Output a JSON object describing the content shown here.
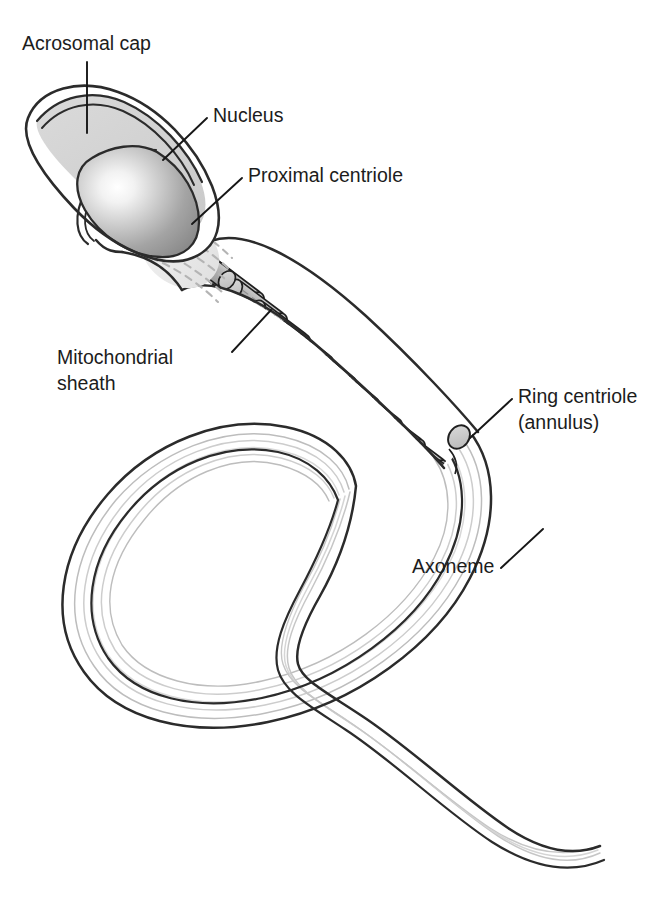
{
  "figure": {
    "background_color": "#ffffff",
    "line_color": "#2b2b2b",
    "text_color": "#1c1c1c"
  },
  "labels": [
    {
      "id": "acrosomal-cap",
      "text": "Acrosomal cap",
      "lines": [
        "Acrosomal cap"
      ],
      "text_x": 22,
      "text_y": 50,
      "anchor": "start",
      "leader": "M 87 62 L 87 133"
    },
    {
      "id": "nucleus",
      "text": "Nucleus",
      "lines": [
        "Nucleus"
      ],
      "text_x": 213,
      "text_y": 122,
      "anchor": "start",
      "leader": "M 207 118 L 163 160"
    },
    {
      "id": "proximal-centriole",
      "text": "Proximal centriole",
      "lines": [
        "Proximal centriole"
      ],
      "text_x": 248,
      "text_y": 182,
      "anchor": "start",
      "leader": "M 242 178 L 192 224"
    },
    {
      "id": "mitochondrial-sheath",
      "text": "Mitochondrial sheath",
      "lines": [
        "Mitochondrial",
        "sheath"
      ],
      "text_x": 57,
      "text_y": 364,
      "anchor": "start",
      "leader": "M 232 352 L 271 310"
    },
    {
      "id": "ring-centriole",
      "text": "Ring centriole (annulus)",
      "lines": [
        "Ring centriole",
        "(annulus)"
      ],
      "text_x": 518,
      "text_y": 403,
      "anchor": "start",
      "leader": "M 512 399 L 470 438"
    },
    {
      "id": "axoneme",
      "text": "Axoneme",
      "lines": [
        "Axoneme"
      ],
      "text_x": 412,
      "text_y": 573,
      "anchor": "start",
      "leader": "M 501 568 L 543 529"
    }
  ],
  "structures": {
    "head": {
      "name": "sperm-head",
      "acrosome_fill": "#d2d2d2",
      "nucleus_fill_center": "#ffffff",
      "nucleus_fill_edge": "#8f8f8f"
    },
    "midpiece": {
      "name": "midpiece",
      "mitochondria_count": 12,
      "mitochondria_fill": "#b0b0b0",
      "cap_fill": "#c9c9c9"
    },
    "tail": {
      "name": "flagellum-tail",
      "fiber_count": 6,
      "fiber_color": "#c4c4c4",
      "outline_color": "#303030"
    },
    "proximal_centriole": {
      "name": "proximal-centriole-body",
      "fill": "#cccccc"
    },
    "annulus": {
      "name": "ring-centriole-body",
      "fill": "#c9c9c9"
    }
  }
}
